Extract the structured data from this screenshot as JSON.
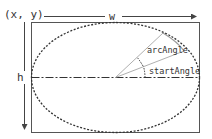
{
  "diagram": {
    "origin_label": "(x, y)",
    "width_label": "w",
    "height_label": "h",
    "arc_angle_label": "arcAngle",
    "start_angle_label": "startAngle",
    "colors": {
      "stroke": "#444444",
      "thin_line": "#9a9a9a",
      "background": "#ffffff"
    }
  }
}
